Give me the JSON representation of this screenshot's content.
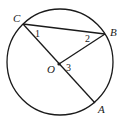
{
  "diagram": {
    "type": "circle-geometry",
    "circle": {
      "center": "O",
      "cx": 60,
      "cy": 62,
      "r": 53
    },
    "points": [
      {
        "name": "C",
        "x": 23,
        "y": 24,
        "label": "C",
        "lx": 13,
        "ly": 22
      },
      {
        "name": "B",
        "x": 105,
        "y": 34,
        "label": "B",
        "lx": 110,
        "ly": 36
      },
      {
        "name": "A",
        "x": 95,
        "y": 103,
        "label": "A",
        "lx": 98,
        "ly": 113
      },
      {
        "name": "O",
        "x": 59,
        "y": 64,
        "label": "O",
        "lx": 47,
        "ly": 73
      }
    ],
    "segments": [
      "CB",
      "CA",
      "OB"
    ],
    "angles": [
      {
        "label": "1",
        "x": 35,
        "y": 37
      },
      {
        "label": "2",
        "x": 85,
        "y": 42
      },
      {
        "label": "3",
        "x": 66,
        "y": 71
      }
    ],
    "colors": {
      "stroke": "#1a1a1a",
      "background": "#ffffff"
    }
  }
}
